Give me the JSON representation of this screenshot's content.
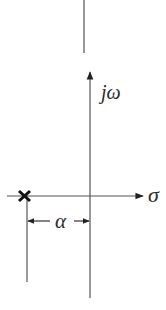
{
  "diagram": {
    "type": "s-plane pole diagram",
    "colors": {
      "line": "#555555",
      "pole": "#111111",
      "text": "#2a2a2a",
      "background": "#ffffff"
    },
    "axes": {
      "imaginary_label": "jω",
      "real_label": "σ"
    },
    "pole": {
      "marker": "×",
      "location_label": "-α"
    },
    "dimension": {
      "label": "α"
    }
  }
}
